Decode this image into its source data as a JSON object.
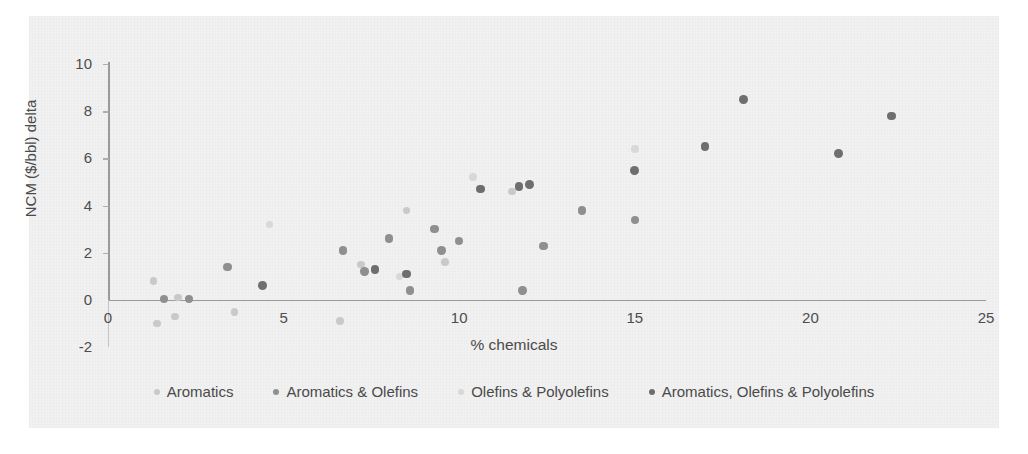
{
  "chart_data": {
    "type": "scatter",
    "title": "",
    "xlabel": "% chemicals",
    "ylabel": "NCM ($/bbl) delta",
    "xlim": [
      0,
      25
    ],
    "ylim": [
      -2,
      10
    ],
    "xticks": [
      "0",
      "5",
      "10",
      "15",
      "20",
      "25"
    ],
    "yticks": [
      "-2",
      "0",
      "2",
      "4",
      "6",
      "8",
      "10"
    ],
    "grid": false,
    "legend_position": "bottom",
    "series": [
      {
        "name": "Aromatics",
        "color": "#c9c9c9",
        "points": [
          [
            1.3,
            0.8
          ],
          [
            1.4,
            -1.0
          ],
          [
            1.9,
            -0.7
          ],
          [
            2.0,
            0.1
          ],
          [
            3.6,
            -0.5
          ],
          [
            6.6,
            -0.9
          ],
          [
            7.2,
            1.5
          ],
          [
            9.6,
            1.6
          ],
          [
            8.5,
            3.8
          ],
          [
            11.5,
            4.6
          ]
        ]
      },
      {
        "name": "Aromatics & Olefins",
        "color": "#8f8f8f",
        "points": [
          [
            1.6,
            0.05
          ],
          [
            2.3,
            0.05
          ],
          [
            3.4,
            1.4
          ],
          [
            6.7,
            2.1
          ],
          [
            7.3,
            1.2
          ],
          [
            8.0,
            2.6
          ],
          [
            8.6,
            0.4
          ],
          [
            9.3,
            3.0
          ],
          [
            9.5,
            2.1
          ],
          [
            10.0,
            2.5
          ],
          [
            11.8,
            0.4
          ],
          [
            12.4,
            2.3
          ],
          [
            13.5,
            3.8
          ],
          [
            15.0,
            3.4
          ]
        ]
      },
      {
        "name": "Olefins & Polyolefins",
        "color": "#d8d8d8",
        "points": [
          [
            4.6,
            3.2
          ],
          [
            8.3,
            1.0
          ],
          [
            10.4,
            5.2
          ],
          [
            15.0,
            6.4
          ]
        ]
      },
      {
        "name": "Aromatics, Olefins & Polyolefins",
        "color": "#6e6e6e",
        "points": [
          [
            4.4,
            0.6
          ],
          [
            7.6,
            1.3
          ],
          [
            8.5,
            1.1
          ],
          [
            10.6,
            4.7
          ],
          [
            11.7,
            4.8
          ],
          [
            12.0,
            4.9
          ],
          [
            15.0,
            5.5
          ],
          [
            17.0,
            6.5
          ],
          [
            18.1,
            8.5
          ],
          [
            20.8,
            6.2
          ],
          [
            22.3,
            7.8
          ]
        ]
      }
    ]
  }
}
